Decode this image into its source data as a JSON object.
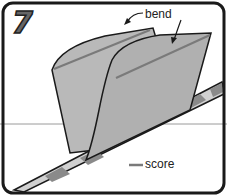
{
  "step": {
    "number": "7"
  },
  "labels": {
    "bend": "bend",
    "score": "score"
  },
  "colors": {
    "paper": "#b9b9b9",
    "paper_dark": "#a8a8a8",
    "score_line": "#7a7a7a",
    "outline": "#1a1a1a",
    "stripe_light": "#d0d0d0",
    "stripe_dark": "#8a8a8a",
    "horizon": "#9a9a9a"
  }
}
